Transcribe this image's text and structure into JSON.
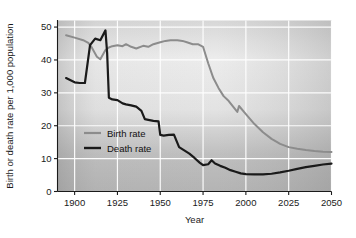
{
  "chart_data": {
    "type": "line",
    "title": "",
    "xlabel": "Year",
    "ylabel": "Birth or death rate per 1,000 population",
    "xlim": [
      1890,
      2050
    ],
    "ylim": [
      0,
      52
    ],
    "xticks": [
      "1900",
      "1925",
      "1950",
      "1975",
      "2000",
      "2025",
      "2050"
    ],
    "xtick_values": [
      1900,
      1925,
      1950,
      1975,
      2000,
      2025,
      2050
    ],
    "yticks": [
      "0",
      "10",
      "20",
      "30",
      "40",
      "50"
    ],
    "ytick_values": [
      0,
      10,
      20,
      30,
      40,
      50
    ],
    "grid": true,
    "legend_position": "inside-lower-left",
    "series": [
      {
        "name": "Birth rate",
        "color": "#8c8c8c",
        "x": [
          1895,
          1900,
          1905,
          1908,
          1910,
          1913,
          1915,
          1918,
          1920,
          1922,
          1925,
          1928,
          1930,
          1933,
          1936,
          1940,
          1943,
          1946,
          1950,
          1953,
          1956,
          1960,
          1963,
          1966,
          1969,
          1972,
          1975,
          1978,
          1981,
          1984,
          1987,
          1990,
          1993,
          1995,
          1996,
          2000,
          2005,
          2010,
          2015,
          2020,
          2025,
          2030,
          2035,
          2040,
          2045,
          2050
        ],
        "values": [
          47.5,
          46.8,
          46.0,
          45.2,
          43.8,
          41.0,
          40.2,
          43.0,
          43.8,
          44.2,
          44.5,
          44.2,
          44.8,
          44.0,
          43.5,
          44.3,
          44.0,
          44.8,
          45.4,
          45.8,
          46.0,
          46.0,
          45.8,
          45.3,
          44.8,
          44.8,
          44.0,
          39.0,
          34.5,
          31.5,
          29.0,
          27.5,
          25.5,
          24.2,
          26.0,
          23.5,
          20.5,
          18.0,
          16.0,
          14.5,
          13.5,
          13.0,
          12.6,
          12.3,
          12.1,
          12.0
        ]
      },
      {
        "name": "Death rate",
        "color": "#1a1a1a",
        "x": [
          1895,
          1900,
          1903,
          1906,
          1909,
          1912,
          1915,
          1918,
          1919,
          1920,
          1922,
          1925,
          1928,
          1930,
          1933,
          1936,
          1939,
          1941,
          1943,
          1946,
          1949,
          1950,
          1952,
          1955,
          1958,
          1961,
          1964,
          1967,
          1970,
          1973,
          1975,
          1978,
          1980,
          1982,
          1985,
          1988,
          1991,
          1994,
          1997,
          2000,
          2005,
          2010,
          2015,
          2020,
          2025,
          2030,
          2035,
          2040,
          2045,
          2050
        ],
        "values": [
          34.5,
          33.2,
          33.0,
          33.0,
          44.5,
          46.5,
          46.0,
          49.0,
          42.0,
          28.5,
          28.0,
          27.8,
          26.8,
          26.5,
          26.2,
          25.8,
          24.5,
          22.0,
          21.8,
          21.5,
          21.3,
          17.2,
          17.0,
          17.2,
          17.3,
          13.5,
          12.5,
          11.5,
          10.2,
          8.8,
          8.0,
          8.3,
          9.5,
          8.5,
          7.8,
          7.2,
          6.5,
          6.0,
          5.5,
          5.3,
          5.2,
          5.2,
          5.4,
          5.8,
          6.3,
          6.9,
          7.4,
          7.8,
          8.2,
          8.5
        ]
      }
    ],
    "legend": [
      {
        "label": "Birth rate",
        "color": "#8c8c8c"
      },
      {
        "label": "Death rate",
        "color": "#1a1a1a"
      }
    ]
  }
}
